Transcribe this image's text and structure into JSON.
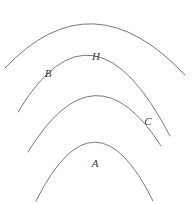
{
  "figure": {
    "background_color": "#ffffff",
    "stroke_color": "#6b6b6b",
    "stroke_width": 0.9,
    "label_color": "#3a3a3a",
    "width": 192,
    "height": 204
  },
  "arcs": [
    {
      "id": "arc-outer",
      "name": "outermost-arc",
      "path": "M 5 68 Q 92 -24 185 75",
      "apex": {
        "x": 92,
        "y": 12
      },
      "left_end": {
        "x": 5,
        "y": 68
      },
      "right_end": {
        "x": 185,
        "y": 75
      },
      "stroke": "#6b6b6b"
    },
    {
      "id": "arc-second",
      "name": "second-arc",
      "path": "M 18 112 Q 93 -13 170 136",
      "apex": {
        "x": 93,
        "y": 52
      },
      "left_end": {
        "x": 18,
        "y": 112
      },
      "right_end": {
        "x": 170,
        "y": 136
      },
      "stroke": "#6b6b6b"
    },
    {
      "id": "arc-third",
      "name": "third-arc",
      "path": "M 28 152 Q 95 42 161 146",
      "apex": {
        "x": 95,
        "y": 100
      },
      "left_end": {
        "x": 28,
        "y": 152
      },
      "right_end": {
        "x": 161,
        "y": 146
      },
      "stroke": "#6b6b6b"
    },
    {
      "id": "arc-inner",
      "name": "innermost-arc",
      "path": "M 36 201 Q 95 83 153 201",
      "apex": {
        "x": 95,
        "y": 141
      },
      "left_end": {
        "x": 36,
        "y": 201
      },
      "right_end": {
        "x": 153,
        "y": 201
      },
      "stroke": "#6b6b6b"
    }
  ],
  "labels": [
    {
      "id": "label-b",
      "text": "B",
      "x": 48,
      "y": 73,
      "arc": "arc-second"
    },
    {
      "id": "label-h",
      "text": "H",
      "x": 96,
      "y": 56,
      "arc": "arc-second"
    },
    {
      "id": "label-c",
      "text": "C",
      "x": 148,
      "y": 121,
      "arc": "arc-third"
    },
    {
      "id": "label-a",
      "text": "A",
      "x": 95,
      "y": 163,
      "arc": "arc-inner"
    }
  ]
}
